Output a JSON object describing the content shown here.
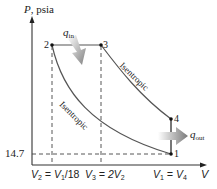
{
  "diagram": {
    "type": "P-v diagram (Diesel cycle)",
    "y_axis": {
      "label_symbol": "P",
      "label_unit": ", psia"
    },
    "x_axis": {
      "label_symbol": "V"
    },
    "y_tick": "14.7",
    "x_ticks": [
      {
        "id": "v2",
        "text_a": "V",
        "sub_a": "2",
        "text_b": " = V",
        "sub_b": "1",
        "text_c": "/18"
      },
      {
        "id": "v3",
        "text_a": "V",
        "sub_a": "3",
        "text_b": " = 2V",
        "sub_b": "2",
        "text_c": ""
      },
      {
        "id": "v1",
        "text_a": "V",
        "sub_a": "1",
        "text_b": " = V",
        "sub_b": "4",
        "text_c": ""
      }
    ],
    "states": [
      {
        "id": "1",
        "label": "1"
      },
      {
        "id": "2",
        "label": "2"
      },
      {
        "id": "3",
        "label": "3"
      },
      {
        "id": "4",
        "label": "4"
      }
    ],
    "processes": {
      "compression": "Isentropic",
      "expansion": "Isentropic"
    },
    "heat": {
      "in": {
        "symbol": "q",
        "sub": "in"
      },
      "out": {
        "symbol": "q",
        "sub": "out"
      }
    },
    "colors": {
      "axis": "#333333",
      "curve": "#555555",
      "dashed": "#444444",
      "arrow_start": "#ffffff",
      "arrow_end": "#7f7f7f"
    }
  }
}
